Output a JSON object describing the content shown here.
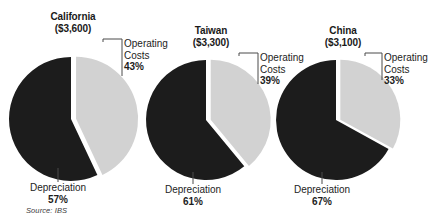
{
  "figure": {
    "source_note": "Source: IBS",
    "colors": {
      "dark_slice": "#1c1c1c",
      "light_slice": "#d2d2d2",
      "background": "#ffffff",
      "leader_line": "#4a4a4a",
      "text": "#1a1a1a"
    }
  },
  "chart_data": {
    "type": "pie",
    "title": "",
    "xlabel": "",
    "ylabel": "",
    "legend_position": "callout-labels",
    "grid": false,
    "categories": [
      "Operating Costs",
      "Depreciation"
    ],
    "charts": [
      {
        "name": "California",
        "value_label": "($3,600)",
        "value": 3600,
        "currency": "USD",
        "slices": [
          {
            "label_line1": "Operating",
            "label_line2": "Costs",
            "percent": 43,
            "percent_text": "43%",
            "color": "#d2d2d2",
            "exploded": true
          },
          {
            "label_line1": "Depreciation",
            "label_line2": "",
            "percent": 57,
            "percent_text": "57%",
            "color": "#1c1c1c",
            "exploded": false
          }
        ]
      },
      {
        "name": "Taiwan",
        "value_label": "($3,300)",
        "value": 3300,
        "currency": "USD",
        "slices": [
          {
            "label_line1": "Operating",
            "label_line2": "Costs",
            "percent": 39,
            "percent_text": "39%",
            "color": "#d2d2d2",
            "exploded": true
          },
          {
            "label_line1": "Depreciation",
            "label_line2": "",
            "percent": 61,
            "percent_text": "61%",
            "color": "#1c1c1c",
            "exploded": false
          }
        ]
      },
      {
        "name": "China",
        "value_label": "($3,100)",
        "value": 3100,
        "currency": "USD",
        "slices": [
          {
            "label_line1": "Operating",
            "label_line2": "Costs",
            "percent": 33,
            "percent_text": "33%",
            "color": "#d2d2d2",
            "exploded": true
          },
          {
            "label_line1": "Depreciation",
            "label_line2": "",
            "percent": 67,
            "percent_text": "67%",
            "color": "#1c1c1c",
            "exploded": false
          }
        ]
      }
    ]
  }
}
